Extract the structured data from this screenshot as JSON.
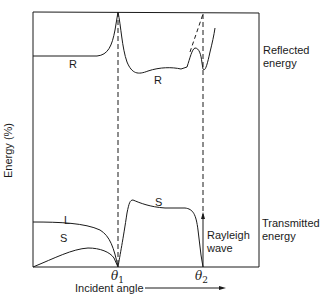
{
  "figure": {
    "y_axis_label": "Energy (%)",
    "x_axis_label": "Incident angle",
    "right_labels": {
      "reflected": [
        "Reflected",
        "energy"
      ],
      "transmitted": [
        "Transmitted",
        "energy"
      ]
    },
    "critical_angles": [
      {
        "symbol": "θ",
        "subscript": "1"
      },
      {
        "symbol": "θ",
        "subscript": "2"
      }
    ],
    "curve_labels": {
      "reflected_left": "R",
      "reflected_right": "R",
      "transmitted_longitudinal": "L",
      "transmitted_shear_left": "S",
      "transmitted_shear_right": "S"
    },
    "annotation": [
      "Rayleigh",
      "wave"
    ],
    "colors": {
      "line": "#1a1a1a",
      "background": "#ffffff"
    }
  }
}
